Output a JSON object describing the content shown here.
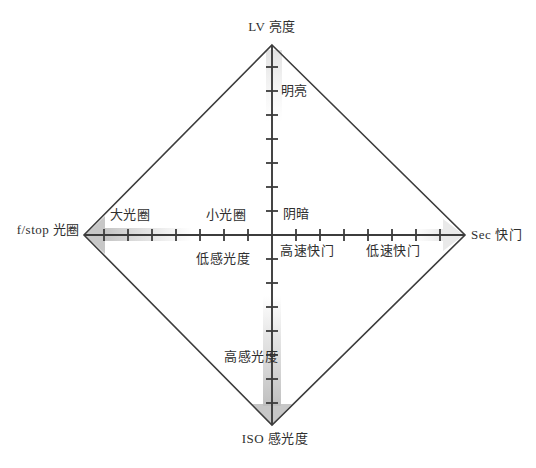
{
  "figure": {
    "background_color": "#ffffff",
    "line_color": "#3c3c3c",
    "text_color": "#2f2f2f",
    "shade_color": "#c3c3c3",
    "shade_color_light": "#e6e6e6",
    "axes": {
      "top": {
        "label": "LV 亮度"
      },
      "bottom": {
        "label": "ISO 感光度"
      },
      "left": {
        "label": "f/stop 光圈"
      },
      "right": {
        "label": "Sec 快门"
      }
    },
    "regions": {
      "bright": "明亮",
      "dark": "阴暗",
      "large_aperture": "大光圈",
      "small_aperture": "小光圈",
      "low_iso": "低感光度",
      "high_iso": "高感光度",
      "fast_shutter": "高速快门",
      "slow_shutter": "低速快门"
    },
    "ticks_per_half_axis": 7,
    "tick_spacing_px": 24
  }
}
